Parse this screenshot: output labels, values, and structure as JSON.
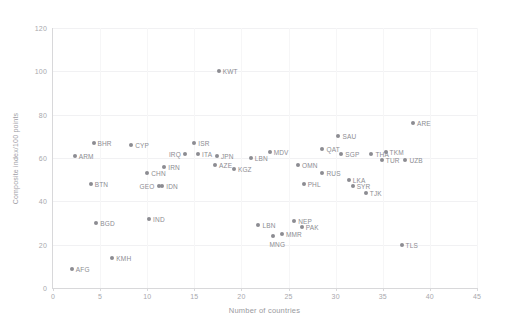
{
  "chart_data": {
    "type": "scatter",
    "title": "",
    "xlabel": "Number of countries",
    "ylabel": "Composite index/100 points",
    "xlim": [
      0,
      45
    ],
    "ylim": [
      0,
      120
    ],
    "xticks": [
      0,
      5,
      10,
      15,
      20,
      25,
      30,
      35,
      40,
      45
    ],
    "yticks": [
      0,
      20,
      40,
      60,
      80,
      100,
      120
    ],
    "grid": true,
    "legend": "none",
    "point_color": "#8c8c92",
    "label_color": "#8c8c92",
    "axis_color": "#d8d8da",
    "tick_text_color": "#a8a8ad",
    "points": [
      {
        "label": "AFG",
        "x": 2.0,
        "y": 9,
        "side": "right"
      },
      {
        "label": "ARM",
        "x": 2.3,
        "y": 61,
        "side": "right"
      },
      {
        "label": "BTN",
        "x": 4.0,
        "y": 48,
        "side": "right"
      },
      {
        "label": "BHR",
        "x": 4.3,
        "y": 67,
        "side": "right"
      },
      {
        "label": "BGD",
        "x": 4.6,
        "y": 30,
        "side": "right"
      },
      {
        "label": "KMH",
        "x": 6.3,
        "y": 14,
        "side": "right"
      },
      {
        "label": "CYP",
        "x": 8.3,
        "y": 66,
        "side": "right"
      },
      {
        "label": "CHN",
        "x": 10.0,
        "y": 53,
        "side": "right"
      },
      {
        "label": "GEO",
        "x": 11.2,
        "y": 47,
        "side": "left"
      },
      {
        "label": "IDN",
        "x": 11.6,
        "y": 47,
        "side": "right"
      },
      {
        "label": "IND",
        "x": 10.2,
        "y": 32,
        "side": "right"
      },
      {
        "label": "IRN",
        "x": 11.8,
        "y": 56,
        "side": "right"
      },
      {
        "label": "IRQ",
        "x": 14.0,
        "y": 62,
        "side": "left"
      },
      {
        "label": "ISR",
        "x": 15.0,
        "y": 67,
        "side": "right"
      },
      {
        "label": "ITA",
        "x": 15.4,
        "y": 62,
        "side": "right"
      },
      {
        "label": "JPN",
        "x": 17.4,
        "y": 61,
        "side": "right"
      },
      {
        "label": "KWT",
        "x": 17.6,
        "y": 100,
        "side": "right"
      },
      {
        "label": "AZE",
        "x": 17.2,
        "y": 57,
        "side": "right"
      },
      {
        "label": "KGZ",
        "x": 19.2,
        "y": 55,
        "side": "right"
      },
      {
        "label": "LBN",
        "x": 21.0,
        "y": 60,
        "side": "right"
      },
      {
        "label": "LBN",
        "x": 21.8,
        "y": 29,
        "side": "right"
      },
      {
        "label": "MDV",
        "x": 23.0,
        "y": 63,
        "side": "right"
      },
      {
        "label": "MNG",
        "x": 23.4,
        "y": 24,
        "side": "below"
      },
      {
        "label": "MMR",
        "x": 24.3,
        "y": 25,
        "side": "right"
      },
      {
        "label": "NEP",
        "x": 25.6,
        "y": 31,
        "side": "right"
      },
      {
        "label": "OMN",
        "x": 26.0,
        "y": 57,
        "side": "right"
      },
      {
        "label": "PAK",
        "x": 26.4,
        "y": 28,
        "side": "right"
      },
      {
        "label": "PHL",
        "x": 26.6,
        "y": 48,
        "side": "right"
      },
      {
        "label": "QAT",
        "x": 28.6,
        "y": 64,
        "side": "right"
      },
      {
        "label": "RUS",
        "x": 28.6,
        "y": 53,
        "side": "right"
      },
      {
        "label": "SAU",
        "x": 30.3,
        "y": 70,
        "side": "right"
      },
      {
        "label": "SGP",
        "x": 30.6,
        "y": 62,
        "side": "right"
      },
      {
        "label": "LKA",
        "x": 31.4,
        "y": 50,
        "side": "right"
      },
      {
        "label": "SYR",
        "x": 31.8,
        "y": 47,
        "side": "right"
      },
      {
        "label": "TJK",
        "x": 33.2,
        "y": 44,
        "side": "right"
      },
      {
        "label": "THA",
        "x": 33.8,
        "y": 62,
        "side": "right"
      },
      {
        "label": "TUR",
        "x": 34.9,
        "y": 59,
        "side": "right"
      },
      {
        "label": "TKM",
        "x": 35.3,
        "y": 63,
        "side": "right"
      },
      {
        "label": "TLS",
        "x": 37.0,
        "y": 20,
        "side": "right"
      },
      {
        "label": "UZB",
        "x": 37.4,
        "y": 59,
        "side": "right"
      },
      {
        "label": "ARE",
        "x": 38.2,
        "y": 76,
        "side": "right"
      }
    ]
  }
}
